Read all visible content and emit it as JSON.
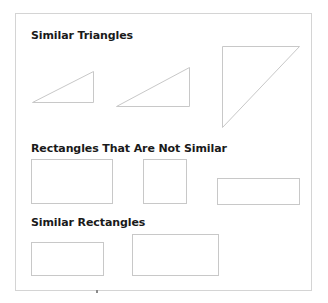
{
  "sections": [
    {
      "title": "Similar Triangles",
      "shapes": [
        {
          "type": "triangle",
          "points": [
            [
              32,
              102
            ],
            [
              93,
              71
            ],
            [
              93,
              102
            ]
          ]
        },
        {
          "type": "triangle",
          "points": [
            [
              116,
              106
            ],
            [
              189,
              67
            ],
            [
              189,
              106
            ]
          ]
        },
        {
          "type": "triangle",
          "points": [
            [
              222,
              46
            ],
            [
              299,
              46
            ],
            [
              222,
              127
            ]
          ]
        }
      ]
    },
    {
      "title": "Rectangles That Are Not Similar",
      "shapes": [
        {
          "type": "rectangle",
          "x": 31,
          "y": 159,
          "width": 81,
          "height": 44
        },
        {
          "type": "rectangle",
          "x": 143,
          "y": 159,
          "width": 43,
          "height": 44
        },
        {
          "type": "rectangle",
          "x": 217,
          "y": 178,
          "width": 82,
          "height": 26
        }
      ]
    },
    {
      "title": "Similar Rectangles",
      "shapes": [
        {
          "type": "rectangle",
          "x": 31,
          "y": 242,
          "width": 72,
          "height": 33
        },
        {
          "type": "rectangle",
          "x": 132,
          "y": 234,
          "width": 86,
          "height": 41
        }
      ]
    }
  ],
  "colors": {
    "frame_border": "#d4d4d4",
    "shape_stroke": "#c8c8c8",
    "heading_text": "#1a1a1a"
  }
}
